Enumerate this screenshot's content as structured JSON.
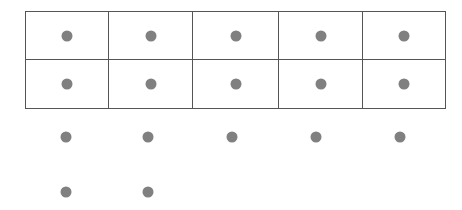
{
  "figure": {
    "kind": "dot-grid-diagram",
    "background_color": "#ffffff",
    "dot_color": "#808080",
    "border_color": "#555555",
    "border_width_px": 1,
    "dot_diameter_px": 11
  },
  "layout": {
    "canvas_width_px": 462,
    "canvas_height_px": 210,
    "table_left_px": 25,
    "table_top_px": 11,
    "table_width_px": 415,
    "table_height_px": 97,
    "column_centers_px": [
      66,
      148,
      232,
      316,
      400
    ],
    "row_centers_px": [
      36,
      84,
      137,
      192
    ],
    "column_dividers_px": [
      107,
      190,
      275,
      358
    ],
    "row_divider_px": 59
  },
  "grid": {
    "columns": 5,
    "bordered_rows": 2,
    "unbordered_rows": 2,
    "bordered_table": [
      {
        "row_index": 0,
        "cells": [
          {
            "dot": true,
            "size_px": 11
          },
          {
            "dot": true,
            "size_px": 11
          },
          {
            "dot": true,
            "size_px": 11
          },
          {
            "dot": true,
            "size_px": 11
          },
          {
            "dot": true,
            "size_px": 11
          }
        ]
      },
      {
        "row_index": 1,
        "cells": [
          {
            "dot": true,
            "size_px": 11
          },
          {
            "dot": true,
            "size_px": 11
          },
          {
            "dot": true,
            "size_px": 11
          },
          {
            "dot": true,
            "size_px": 11
          },
          {
            "dot": true,
            "size_px": 11
          }
        ]
      }
    ],
    "loose_rows": [
      {
        "row_index": 2,
        "y_px": 137,
        "dots": [
          {
            "x_px": 66,
            "size_px": 11
          },
          {
            "x_px": 148,
            "size_px": 11
          },
          {
            "x_px": 232,
            "size_px": 11
          },
          {
            "x_px": 316,
            "size_px": 11
          },
          {
            "x_px": 400,
            "size_px": 11
          }
        ]
      },
      {
        "row_index": 3,
        "y_px": 192,
        "dots": [
          {
            "x_px": 66,
            "size_px": 11
          },
          {
            "x_px": 148,
            "size_px": 11
          }
        ]
      }
    ]
  },
  "totals": {
    "dot_count": 17,
    "bordered_dot_count": 10,
    "loose_dot_count": 7
  }
}
